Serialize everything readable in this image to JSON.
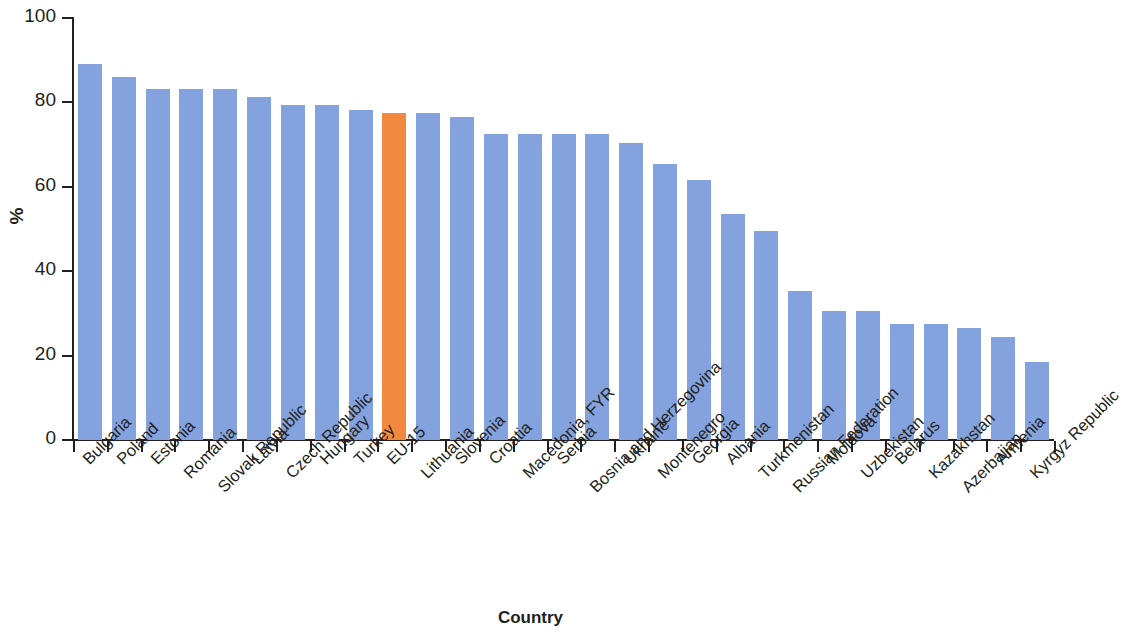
{
  "chart_data": {
    "type": "bar",
    "title": "",
    "xlabel": "Country",
    "ylabel": "%",
    "ylim": [
      0,
      100
    ],
    "yticks": [
      0,
      20,
      40,
      60,
      80,
      100
    ],
    "grid": false,
    "legend": null,
    "categories": [
      "Bulgaria",
      "Poland",
      "Estonia",
      "Romania",
      "Slovak Republic",
      "Latvia",
      "Czech Republic",
      "Hungary",
      "Turkey",
      "EU-15",
      "Lithuania",
      "Slovenia",
      "Croatia",
      "Macedonia, FYR",
      "Serbia",
      "Bosnia and Herzegovina",
      "Ukraine",
      "Montenegro",
      "Georgia",
      "Albania",
      "Turkmenistan",
      "Russian Federation",
      "Moldova",
      "Uzbekistan",
      "Belarus",
      "Kazakhstan",
      "Azerbaijan",
      "Armenia",
      "Kyrgyz Republic"
    ],
    "values": [
      89.2,
      86.0,
      83.1,
      83.1,
      83.1,
      81.2,
      79.3,
      79.4,
      78.3,
      77.5,
      77.6,
      76.5,
      72.4,
      72.4,
      72.4,
      72.4,
      70.4,
      65.5,
      61.5,
      53.5,
      49.5,
      35.4,
      30.5,
      30.5,
      27.6,
      27.6,
      26.6,
      24.5,
      18.4
    ],
    "highlight_index": 9,
    "colors": {
      "bar": "#84a3de",
      "bar_highlight": "#f3893f",
      "axis": "#231f20",
      "background": "#ffffff",
      "text": "#231f20"
    }
  },
  "axis": {
    "y_tick_labels": [
      "100",
      "80",
      "60",
      "40",
      "20",
      "0"
    ],
    "y_title": "%",
    "x_title": "Country"
  }
}
